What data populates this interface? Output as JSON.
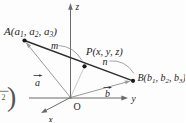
{
  "diagram": {
    "axis": {
      "z": "z",
      "y": "y",
      "x": "x",
      "origin": "O"
    },
    "point_a": {
      "pre": "A(a",
      "sub1": "1",
      "mid1": ", a",
      "sub2": "2",
      "mid2": ", a",
      "sub3": "3",
      "post": ")"
    },
    "point_p": {
      "label": "P(x, y, z)"
    },
    "point_b": {
      "pre": "B(b",
      "sub1": "1",
      "mid1": ", b",
      "sub2": "2",
      "mid2": ", b",
      "sub3": "3",
      "post": ")"
    },
    "segment_ap_label": "m",
    "segment_pb_label": "n",
    "vector_a_label": "a",
    "vector_b_label": "b",
    "edge_fragment": {
      "denominator": "2",
      "paren": ")"
    },
    "colors": {
      "background": "#fdfdfd",
      "main_line": "#2d2d2d",
      "axis_line": "#6b6b6b",
      "vector_line": "#9a9a9a",
      "op_line": "#c2c2c2",
      "leader_line": "#8c8c8c",
      "text": "#1e1e1e",
      "fragment": "#555555"
    }
  }
}
